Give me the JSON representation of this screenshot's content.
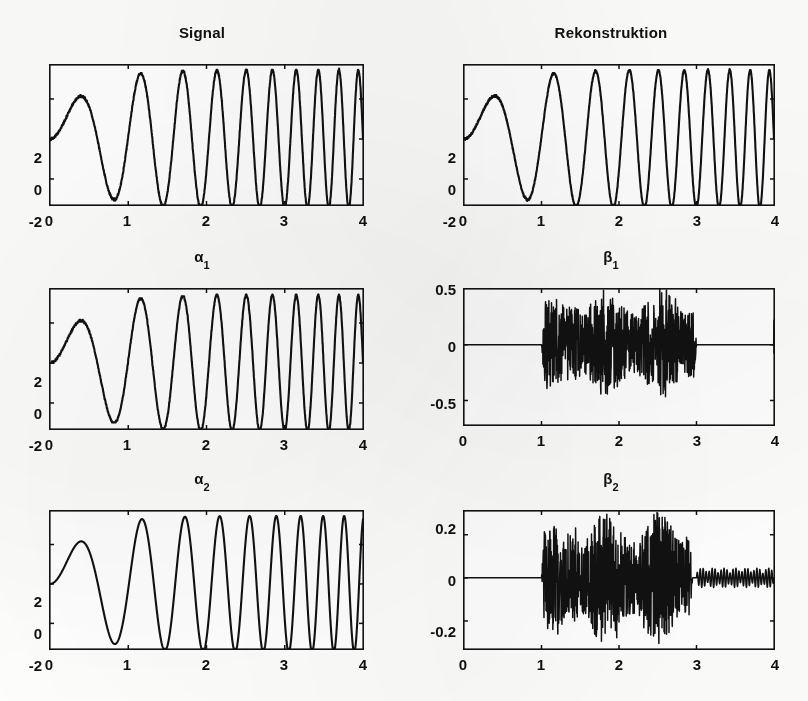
{
  "figure": {
    "background_color": "#fdfdfc",
    "ink_color": "#111111",
    "panel_count": 6
  },
  "panels": {
    "signal": {
      "title": "Signal",
      "title_base": "Signal",
      "title_sub": ""
    },
    "rekonstruktion": {
      "title": "Rekonstruktion",
      "title_base": "Rekonstruktion",
      "title_sub": ""
    },
    "alpha1": {
      "title": "α1",
      "title_base": "α",
      "title_sub": "1"
    },
    "beta1": {
      "title": "β1",
      "title_base": "β",
      "title_sub": "1"
    },
    "alpha2": {
      "title": "α2",
      "title_base": "α",
      "title_sub": "2"
    },
    "beta2": {
      "title": "β2",
      "title_base": "β",
      "title_sub": "2"
    }
  },
  "chart_data": [
    {
      "id": "signal",
      "type": "line",
      "title": "Signal",
      "xlabel": "",
      "ylabel": "",
      "xlim": [
        0,
        4
      ],
      "ylim": [
        -3.3,
        3.7
      ],
      "xticks": [
        0,
        1,
        2,
        3,
        4
      ],
      "xticklabels": [
        "0",
        "1",
        "2",
        "3",
        "4"
      ],
      "yticks": [
        -2,
        0,
        2
      ],
      "yticklabels": [
        "-2",
        "0",
        "2"
      ],
      "grid": false,
      "legend": "none",
      "description": "Amplitude-modulated frequency chirp: sine whose instantaneous frequency increases with time, envelope rising from 0 to about 3.4, drawn with a rough quantized (staircase) stroke from scanning.",
      "generator": {
        "kind": "chirp",
        "amplitude": 3.45,
        "envelope": "ramp-saturating",
        "f0": 0.55,
        "f1": 4.2,
        "phase": 0.0,
        "jitter": 0.05,
        "quantize": 0.055,
        "samples": 1700
      }
    },
    {
      "id": "rekonstruktion",
      "type": "line",
      "title": "Rekonstruktion",
      "xlabel": "",
      "ylabel": "",
      "xlim": [
        0,
        4
      ],
      "ylim": [
        -3.3,
        3.7
      ],
      "xticks": [
        0,
        1,
        2,
        3,
        4
      ],
      "xticklabels": [
        "0",
        "1",
        "2",
        "3",
        "4"
      ],
      "yticks": [
        -2,
        0,
        2
      ],
      "yticklabels": [
        "-2",
        "0",
        "2"
      ],
      "grid": false,
      "legend": "none",
      "description": "Reconstruction of the signal; visually nearly identical to the Signal panel, with the same chirp shape and rough quantized stroke.",
      "generator": {
        "kind": "chirp",
        "amplitude": 3.45,
        "envelope": "ramp-saturating",
        "f0": 0.55,
        "f1": 4.2,
        "phase": 0.0,
        "jitter": 0.045,
        "quantize": 0.05,
        "samples": 1700
      }
    },
    {
      "id": "alpha1",
      "type": "line",
      "title": "α1",
      "xlabel": "",
      "ylabel": "",
      "xlim": [
        0,
        4
      ],
      "ylim": [
        -3.3,
        3.7
      ],
      "xticks": [
        0,
        1,
        2,
        3,
        4
      ],
      "xticklabels": [
        "0",
        "1",
        "2",
        "3",
        "4"
      ],
      "yticks": [
        -2,
        0,
        2
      ],
      "yticklabels": [
        "-2",
        "0",
        "2"
      ],
      "grid": false,
      "legend": "none",
      "description": "First-level approximation coefficients: same chirp as the signal but slightly smoothed with visible staircase/quantization on the rising and falling flanks.",
      "generator": {
        "kind": "chirp",
        "amplitude": 3.4,
        "envelope": "ramp-saturating",
        "f0": 0.55,
        "f1": 4.2,
        "phase": 0.0,
        "jitter": 0.03,
        "quantize": 0.09,
        "samples": 1400
      }
    },
    {
      "id": "beta1",
      "type": "line",
      "title": "β1",
      "xlabel": "",
      "ylabel": "",
      "xlim": [
        0,
        4
      ],
      "ylim": [
        -0.72,
        0.5
      ],
      "xticks": [
        0,
        1,
        2,
        3,
        4
      ],
      "xticklabels": [
        "0",
        "1",
        "2",
        "3",
        "4"
      ],
      "yticks": [
        -0.5,
        0,
        0.5
      ],
      "yticklabels": [
        "-0.5",
        "0",
        "0.5"
      ],
      "grid": false,
      "legend": "none",
      "description": "First-level detail coefficients: flat zero until x=1, dense high-frequency noise burst with peaks near +0.5 and -0.45 between x=1 and x=3, flat zero afterwards with a single narrow spike at x=4.",
      "generator": {
        "kind": "noise-burst",
        "burst_start": 1.0,
        "burst_end": 3.0,
        "peak_positive": 0.5,
        "peak_negative": -0.46,
        "tail_amplitude": 0.0,
        "edge_spike_x": 4.0,
        "edge_spike_amplitude": 0.22,
        "samples": 1300
      }
    },
    {
      "id": "alpha2",
      "type": "line",
      "title": "α2",
      "xlabel": "",
      "ylabel": "",
      "xlim": [
        0,
        4
      ],
      "ylim": [
        -3.3,
        3.7
      ],
      "xticks": [
        0,
        1,
        2,
        3,
        4
      ],
      "xticklabels": [
        "0",
        "1",
        "2",
        "3",
        "4"
      ],
      "yticks": [
        -2,
        0,
        2
      ],
      "yticklabels": [
        "-2",
        "0",
        "2"
      ],
      "grid": false,
      "legend": "none",
      "description": "Second-level approximation coefficients: a clean smooth chirp, visibly smoother than alpha1, with oscillation peaks clipped at the top frame.",
      "generator": {
        "kind": "chirp",
        "amplitude": 3.45,
        "envelope": "ramp-saturating",
        "f0": 0.55,
        "f1": 4.05,
        "phase": 0.0,
        "jitter": 0.0,
        "quantize": 0.0,
        "samples": 1400
      }
    },
    {
      "id": "beta2",
      "type": "line",
      "title": "β2",
      "xlabel": "",
      "ylabel": "",
      "xlim": [
        0,
        4
      ],
      "ylim": [
        -0.33,
        0.31
      ],
      "xticks": [
        0,
        1,
        2,
        3,
        4
      ],
      "xticklabels": [
        "0",
        "1",
        "2",
        "3",
        "4"
      ],
      "yticks": [
        -0.2,
        0,
        0.2
      ],
      "yticklabels": [
        "-0.2",
        "0",
        "0.2"
      ],
      "grid": false,
      "legend": "none",
      "description": "Second-level detail coefficients: flat zero until x=1, dense noise burst from x=1 to x=3 with peaks near 0.3 and -0.3 (a few spikes clipped at the frame near x=2 and x=2.9), then a small modulated ripple of amplitude about 0.04 from x=3 to x=4.",
      "generator": {
        "kind": "noise-burst",
        "burst_start": 1.0,
        "burst_end": 2.95,
        "peak_positive": 0.3,
        "peak_negative": -0.3,
        "tail_amplitude": 0.045,
        "tail_start": 3.0,
        "tail_modulation_periods": 7,
        "samples": 1500
      }
    }
  ]
}
